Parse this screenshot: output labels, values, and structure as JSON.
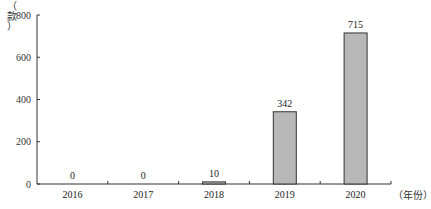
{
  "chart_data": {
    "type": "bar",
    "title": "",
    "xlabel": "（年份）",
    "ylabel": "（款）",
    "categories": [
      "2016",
      "2017",
      "2018",
      "2019",
      "2020"
    ],
    "values": [
      0,
      0,
      10,
      342,
      715
    ],
    "data_labels": [
      "0",
      "0",
      "10",
      "342",
      "715"
    ],
    "ylim": [
      0,
      800
    ],
    "yticks": [
      0,
      200,
      400,
      600,
      800
    ],
    "grid": false,
    "legend": null,
    "bar_color": "#b8b8b8",
    "bar_edge_color": "#333333"
  },
  "axis": {
    "ylabel_chars": [
      "（",
      "款",
      "）"
    ],
    "xunit_label": "（年份）"
  }
}
